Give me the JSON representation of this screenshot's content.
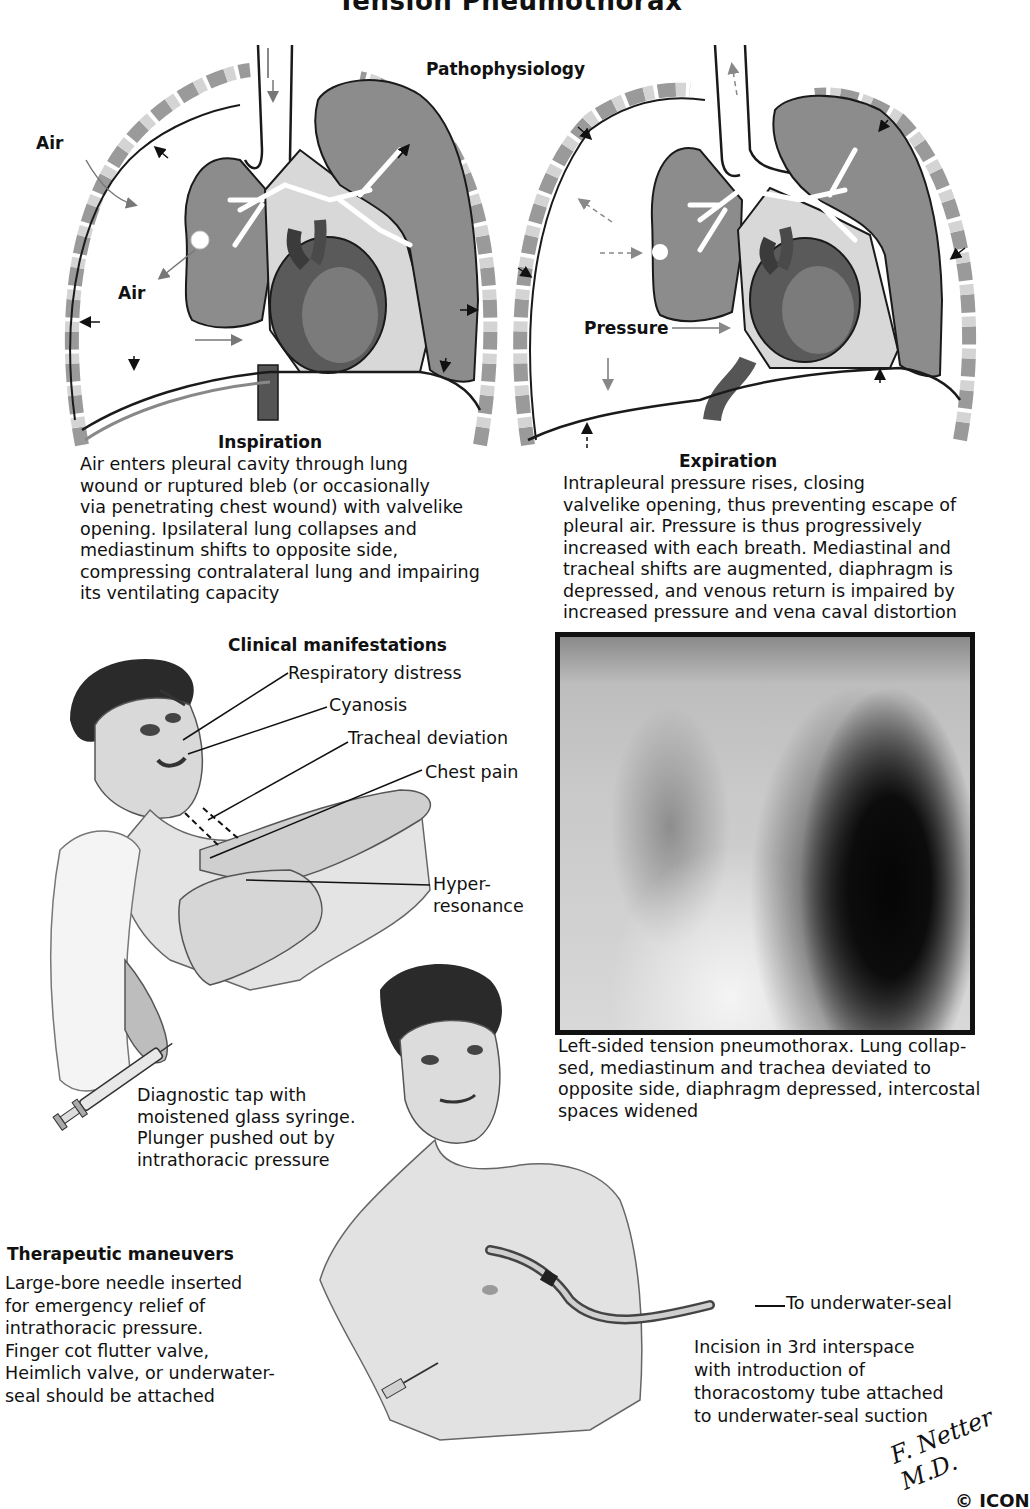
{
  "page": {
    "title": "Tension Pneumothorax",
    "section_title": "Pathophysiology"
  },
  "pathophysiology": {
    "inspiration": {
      "labels": {
        "air_outer": "Air",
        "air_inner": "Air"
      },
      "heading": "Inspiration",
      "description": "Air enters pleural cavity through lung\nwound or ruptured bleb (or occasionally\nvia penetrating chest wound) with valvelike\nopening. Ipsilateral lung collapses and\nmediastinum shifts to opposite side,\ncompressing contralateral lung and impairing\nits ventilating capacity"
    },
    "expiration": {
      "labels": {
        "pressure": "Pressure"
      },
      "heading": "Expiration",
      "description": "Intrapleural pressure rises, closing\nvalvelike opening, thus preventing escape of\npleural air. Pressure is thus progressively\nincreased with each breath. Mediastinal and\ntracheal shifts are augmented, diaphragm is\ndepressed, and venous return is impaired by\nincreased pressure and vena caval distortion"
    }
  },
  "clinical": {
    "heading": "Clinical manifestations",
    "signs": [
      {
        "label": "Respiratory distress"
      },
      {
        "label": "Cyanosis"
      },
      {
        "label": "Tracheal deviation"
      },
      {
        "label": "Chest pain"
      },
      {
        "label": "Hyper-\nresonance"
      }
    ],
    "diagnostic_tap": "Diagnostic tap with\nmoistened glass syringe.\nPlunger pushed out by\nintrathoracic pressure"
  },
  "xray": {
    "caption": "Left-sided tension pneumothorax. Lung collap-\nsed, mediastinum and trachea deviated to\nopposite side, diaphragm depressed, intercostal\nspaces widened"
  },
  "therapeutic": {
    "heading": "Therapeutic maneuvers",
    "needle_text": "Large-bore needle inserted\nfor emergency relief of\nintrathoracic pressure.\nFinger cot flutter valve,\nHeimlich valve, or underwater-\nseal should be attached",
    "tube_label": "To underwater-seal",
    "incision_text": "Incision in 3rd interspace\nwith introduction of\nthoracostomy tube attached\nto underwater-seal suction"
  },
  "credits": {
    "signature": "F. Netter M.D.",
    "copyright": "© ICON"
  },
  "colors": {
    "lung_fill": "#8c8c8c",
    "pleura_line": "#1a1a1a",
    "rib_light": "#cfcfcf",
    "rib_dark": "#7a7a7a",
    "text": "#111111"
  }
}
